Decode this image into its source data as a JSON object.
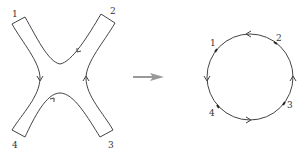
{
  "diagram": {
    "colors": {
      "line": "#444444",
      "arrow": "#999999",
      "background": "#ffffff"
    },
    "left_figure": {
      "shape": "x-shaped-ribbon",
      "labels": [
        "1",
        "2",
        "3",
        "4"
      ],
      "orientation_arrows": 4
    },
    "transform_arrow": {
      "direction": "right"
    },
    "right_figure": {
      "shape": "circle",
      "labels": [
        "1",
        "2",
        "3",
        "4"
      ],
      "orientation_arrows": 4
    }
  }
}
